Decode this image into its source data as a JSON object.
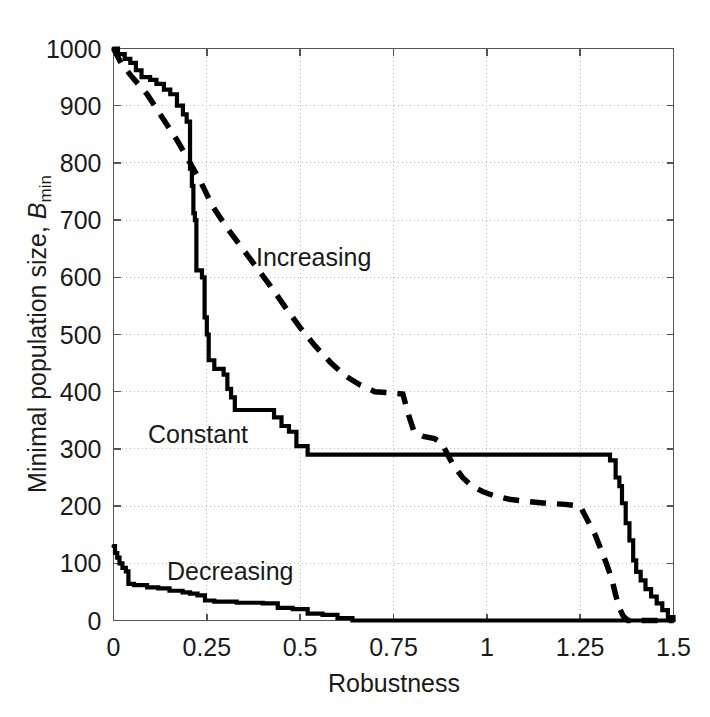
{
  "chart_data": {
    "type": "line",
    "title": "",
    "xlabel": "Robustness",
    "ylabel": "Minimal population size, B_min",
    "xlim": [
      0,
      1.5
    ],
    "ylim": [
      0,
      1000
    ],
    "xticks": [
      "0",
      "0.25",
      "0.5",
      "0.75",
      "1",
      "1.25",
      "1.5"
    ],
    "xtick_values": [
      0,
      0.25,
      0.5,
      0.75,
      1,
      1.25,
      1.5
    ],
    "yticks": [
      "0",
      "100",
      "200",
      "300",
      "400",
      "500",
      "600",
      "700",
      "800",
      "900",
      "1000"
    ],
    "ytick_values": [
      0,
      100,
      200,
      300,
      400,
      500,
      600,
      700,
      800,
      900,
      1000
    ],
    "grid": true,
    "grid_style": "dotted",
    "legend_position": "inline-annotations",
    "background": "#ffffff",
    "line_color": "#000000",
    "series": [
      {
        "name": "Constant",
        "style": "solid",
        "label_x": 0.23,
        "label_y": 330,
        "points": [
          [
            0.0,
            1000
          ],
          [
            0.012,
            1000
          ],
          [
            0.012,
            990
          ],
          [
            0.03,
            990
          ],
          [
            0.03,
            982
          ],
          [
            0.045,
            982
          ],
          [
            0.045,
            975
          ],
          [
            0.06,
            975
          ],
          [
            0.06,
            962
          ],
          [
            0.075,
            962
          ],
          [
            0.075,
            950
          ],
          [
            0.098,
            950
          ],
          [
            0.098,
            945
          ],
          [
            0.115,
            945
          ],
          [
            0.115,
            938
          ],
          [
            0.135,
            938
          ],
          [
            0.135,
            928
          ],
          [
            0.152,
            928
          ],
          [
            0.152,
            920
          ],
          [
            0.17,
            920
          ],
          [
            0.17,
            900
          ],
          [
            0.186,
            900
          ],
          [
            0.186,
            885
          ],
          [
            0.196,
            885
          ],
          [
            0.196,
            872
          ],
          [
            0.205,
            872
          ],
          [
            0.205,
            790
          ],
          [
            0.21,
            790
          ],
          [
            0.21,
            760
          ],
          [
            0.214,
            760
          ],
          [
            0.214,
            712
          ],
          [
            0.218,
            712
          ],
          [
            0.218,
            700
          ],
          [
            0.222,
            700
          ],
          [
            0.222,
            612
          ],
          [
            0.237,
            612
          ],
          [
            0.237,
            600
          ],
          [
            0.244,
            600
          ],
          [
            0.244,
            530
          ],
          [
            0.25,
            530
          ],
          [
            0.25,
            500
          ],
          [
            0.255,
            500
          ],
          [
            0.255,
            455
          ],
          [
            0.27,
            455
          ],
          [
            0.27,
            440
          ],
          [
            0.295,
            440
          ],
          [
            0.295,
            430
          ],
          [
            0.305,
            430
          ],
          [
            0.305,
            405
          ],
          [
            0.315,
            405
          ],
          [
            0.315,
            390
          ],
          [
            0.325,
            390
          ],
          [
            0.325,
            368
          ],
          [
            0.43,
            368
          ],
          [
            0.43,
            355
          ],
          [
            0.45,
            355
          ],
          [
            0.45,
            340
          ],
          [
            0.47,
            340
          ],
          [
            0.47,
            330
          ],
          [
            0.49,
            330
          ],
          [
            0.49,
            305
          ],
          [
            0.52,
            305
          ],
          [
            0.52,
            290
          ],
          [
            1.33,
            290
          ],
          [
            1.33,
            280
          ],
          [
            1.345,
            280
          ],
          [
            1.345,
            250
          ],
          [
            1.355,
            250
          ],
          [
            1.355,
            235
          ],
          [
            1.362,
            235
          ],
          [
            1.362,
            205
          ],
          [
            1.372,
            205
          ],
          [
            1.372,
            170
          ],
          [
            1.382,
            170
          ],
          [
            1.382,
            140
          ],
          [
            1.392,
            140
          ],
          [
            1.392,
            105
          ],
          [
            1.4,
            105
          ],
          [
            1.4,
            85
          ],
          [
            1.412,
            85
          ],
          [
            1.412,
            70
          ],
          [
            1.425,
            70
          ],
          [
            1.425,
            55
          ],
          [
            1.44,
            55
          ],
          [
            1.44,
            42
          ],
          [
            1.455,
            42
          ],
          [
            1.455,
            30
          ],
          [
            1.47,
            30
          ],
          [
            1.47,
            18
          ],
          [
            1.485,
            18
          ],
          [
            1.485,
            6
          ],
          [
            1.5,
            6
          ],
          [
            1.5,
            0
          ]
        ]
      },
      {
        "name": "Increasing",
        "style": "dashed",
        "label_x": 0.6,
        "label_y": 660,
        "points": [
          [
            0.0,
            1000
          ],
          [
            0.02,
            975
          ],
          [
            0.05,
            950
          ],
          [
            0.09,
            920
          ],
          [
            0.13,
            880
          ],
          [
            0.17,
            840
          ],
          [
            0.205,
            800
          ],
          [
            0.235,
            765
          ],
          [
            0.265,
            725
          ],
          [
            0.3,
            690
          ],
          [
            0.34,
            655
          ],
          [
            0.38,
            620
          ],
          [
            0.42,
            585
          ],
          [
            0.46,
            548
          ],
          [
            0.5,
            512
          ],
          [
            0.54,
            480
          ],
          [
            0.58,
            452
          ],
          [
            0.62,
            428
          ],
          [
            0.66,
            412
          ],
          [
            0.7,
            400
          ],
          [
            0.74,
            398
          ],
          [
            0.775,
            396
          ],
          [
            0.79,
            360
          ],
          [
            0.805,
            330
          ],
          [
            0.83,
            322
          ],
          [
            0.86,
            318
          ],
          [
            0.88,
            310
          ],
          [
            0.895,
            290
          ],
          [
            0.91,
            272
          ],
          [
            0.935,
            250
          ],
          [
            0.96,
            235
          ],
          [
            0.99,
            225
          ],
          [
            1.02,
            218
          ],
          [
            1.06,
            212
          ],
          [
            1.11,
            208
          ],
          [
            1.16,
            205
          ],
          [
            1.21,
            203
          ],
          [
            1.25,
            200
          ],
          [
            1.27,
            175
          ],
          [
            1.29,
            150
          ],
          [
            1.305,
            125
          ],
          [
            1.32,
            100
          ],
          [
            1.335,
            72
          ],
          [
            1.345,
            45
          ],
          [
            1.355,
            22
          ],
          [
            1.365,
            8
          ],
          [
            1.378,
            0
          ],
          [
            1.5,
            0
          ]
        ]
      },
      {
        "name": "Decreasing",
        "style": "solid",
        "label_x": 0.17,
        "label_y": 60,
        "points": [
          [
            0.0,
            130
          ],
          [
            0.004,
            130
          ],
          [
            0.004,
            118
          ],
          [
            0.01,
            118
          ],
          [
            0.01,
            110
          ],
          [
            0.016,
            110
          ],
          [
            0.016,
            100
          ],
          [
            0.024,
            100
          ],
          [
            0.024,
            92
          ],
          [
            0.033,
            92
          ],
          [
            0.033,
            86
          ],
          [
            0.04,
            86
          ],
          [
            0.04,
            64
          ],
          [
            0.055,
            64
          ],
          [
            0.055,
            62
          ],
          [
            0.09,
            62
          ],
          [
            0.09,
            58
          ],
          [
            0.12,
            58
          ],
          [
            0.12,
            56
          ],
          [
            0.15,
            56
          ],
          [
            0.15,
            52
          ],
          [
            0.185,
            52
          ],
          [
            0.185,
            49
          ],
          [
            0.205,
            49
          ],
          [
            0.205,
            47
          ],
          [
            0.225,
            47
          ],
          [
            0.225,
            44
          ],
          [
            0.245,
            44
          ],
          [
            0.245,
            35
          ],
          [
            0.27,
            35
          ],
          [
            0.27,
            33
          ],
          [
            0.33,
            33
          ],
          [
            0.33,
            31
          ],
          [
            0.4,
            31
          ],
          [
            0.4,
            30
          ],
          [
            0.44,
            30
          ],
          [
            0.44,
            22
          ],
          [
            0.48,
            22
          ],
          [
            0.48,
            20
          ],
          [
            0.52,
            20
          ],
          [
            0.52,
            12
          ],
          [
            0.56,
            12
          ],
          [
            0.56,
            10
          ],
          [
            0.6,
            10
          ],
          [
            0.6,
            4
          ],
          [
            0.64,
            4
          ],
          [
            0.64,
            0
          ],
          [
            1.5,
            0
          ]
        ]
      }
    ]
  },
  "labels": {
    "x_title": "Robustness",
    "y_title_main": "Minimal population size, ",
    "y_title_var": "B",
    "y_title_sub": "min",
    "series_increasing": "Increasing",
    "series_constant": "Constant",
    "series_decreasing": "Decreasing"
  },
  "axes": {
    "x": [
      "0",
      "0.25",
      "0.5",
      "0.75",
      "1",
      "1.25",
      "1.5"
    ],
    "y": [
      "1000",
      "900",
      "800",
      "700",
      "600",
      "500",
      "400",
      "300",
      "200",
      "100",
      "0"
    ]
  },
  "colors": {
    "line": "#000000",
    "axis": "#555555",
    "grid": "#bbbbbb",
    "text": "#1a1a1a",
    "background": "#ffffff"
  }
}
